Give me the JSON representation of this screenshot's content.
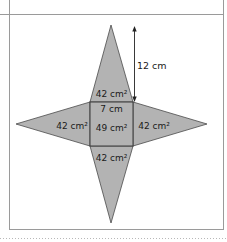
{
  "diagram": {
    "type": "square-based pyramid net",
    "colors": {
      "face_fill": "#b3b3b3",
      "face_stroke": "#4a4a4a",
      "frame_line": "#9a9a9a",
      "dotted_line": "#b8b8b8",
      "text": "#1a1a1a"
    },
    "base": {
      "side_label": "7 cm",
      "area_label": "49 cm²"
    },
    "faces": {
      "top": "42 cm²",
      "left": "42 cm²",
      "right": "42 cm²",
      "bottom": "42 cm²"
    },
    "height_arrow": {
      "label": "12 cm"
    }
  }
}
